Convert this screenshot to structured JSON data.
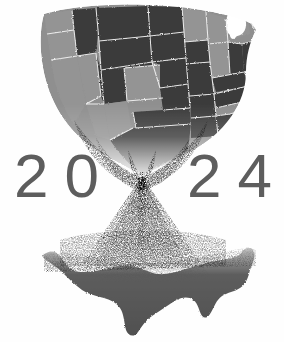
{
  "image": {
    "kind": "editorial-illustration",
    "subject": "2024 United States election hourglass",
    "background_color": "#fefefe",
    "width": 284,
    "height": 342
  },
  "year_label": {
    "full_text": "2024",
    "digits": [
      "2",
      "0",
      "2",
      "4"
    ],
    "color": "#5d5d5d"
  },
  "palette": {
    "background": "#fefefe",
    "state_dark": "#3c3c3c",
    "state_light": "#939393",
    "state_border": "#f2f2f2",
    "silhouette": "#4f4f4f",
    "sand_grain": "#6b6b6b",
    "digit_gray": "#5d5d5d"
  },
  "upper_map": {
    "name": "united-states-bowl-map",
    "description": "Contiguous United States warped into the upper bowl of an hourglass, states shaded in two tones with pale borders, lower edge dissolving into sand grains",
    "tone_legend": [
      {
        "tone": "dark",
        "hex": "#3c3c3c"
      },
      {
        "tone": "light",
        "hex": "#939393"
      }
    ],
    "states": [
      {
        "code": "WA",
        "tone": "light"
      },
      {
        "code": "OR",
        "tone": "light"
      },
      {
        "code": "CA",
        "tone": "light"
      },
      {
        "code": "NV",
        "tone": "light"
      },
      {
        "code": "ID",
        "tone": "dark"
      },
      {
        "code": "MT",
        "tone": "dark"
      },
      {
        "code": "WY",
        "tone": "dark"
      },
      {
        "code": "UT",
        "tone": "dark"
      },
      {
        "code": "AZ",
        "tone": "light"
      },
      {
        "code": "CO",
        "tone": "light"
      },
      {
        "code": "NM",
        "tone": "light"
      },
      {
        "code": "ND",
        "tone": "dark"
      },
      {
        "code": "SD",
        "tone": "dark"
      },
      {
        "code": "NE",
        "tone": "dark"
      },
      {
        "code": "KS",
        "tone": "dark"
      },
      {
        "code": "OK",
        "tone": "dark"
      },
      {
        "code": "TX",
        "tone": "dark"
      },
      {
        "code": "MN",
        "tone": "light"
      },
      {
        "code": "IA",
        "tone": "dark"
      },
      {
        "code": "MO",
        "tone": "dark"
      },
      {
        "code": "AR",
        "tone": "dark"
      },
      {
        "code": "LA",
        "tone": "dark"
      },
      {
        "code": "WI",
        "tone": "light"
      },
      {
        "code": "IL",
        "tone": "light"
      },
      {
        "code": "MI",
        "tone": "light"
      },
      {
        "code": "IN",
        "tone": "dark"
      },
      {
        "code": "OH",
        "tone": "dark"
      },
      {
        "code": "KY",
        "tone": "dark"
      },
      {
        "code": "TN",
        "tone": "dark"
      },
      {
        "code": "MS",
        "tone": "dark"
      },
      {
        "code": "AL",
        "tone": "dark"
      },
      {
        "code": "GA",
        "tone": "dark"
      },
      {
        "code": "FL",
        "tone": "dark"
      },
      {
        "code": "SC",
        "tone": "dark"
      },
      {
        "code": "NC",
        "tone": "dark"
      },
      {
        "code": "VA",
        "tone": "light"
      },
      {
        "code": "WV",
        "tone": "dark"
      },
      {
        "code": "PA",
        "tone": "light"
      },
      {
        "code": "NY",
        "tone": "light"
      },
      {
        "code": "VT",
        "tone": "light"
      },
      {
        "code": "NH",
        "tone": "light"
      },
      {
        "code": "ME",
        "tone": "light"
      },
      {
        "code": "MA",
        "tone": "light"
      },
      {
        "code": "CT",
        "tone": "light"
      },
      {
        "code": "RI",
        "tone": "light"
      },
      {
        "code": "NJ",
        "tone": "light"
      },
      {
        "code": "DE",
        "tone": "light"
      },
      {
        "code": "MD",
        "tone": "light"
      }
    ]
  },
  "sand_stream": {
    "name": "falling-sand-stream",
    "description": "Narrow pinched waist of grains at mid-height widening into a downward cone of scattered particles",
    "neck_x": 142,
    "neck_y": 178
  },
  "lower_map": {
    "name": "united-states-silhouette-pile",
    "description": "Solid dark silhouette of the contiguous United States formed by the collected sand in the bottom of the hourglass",
    "color": "#4f4f4f"
  }
}
